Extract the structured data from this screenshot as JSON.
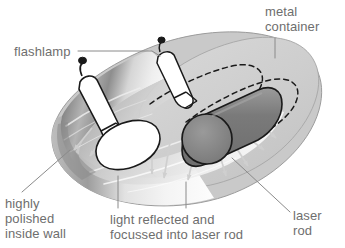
{
  "figure": {
    "background_color": "#ffffff",
    "label_color": "#6e6e6e"
  },
  "labels": {
    "metal_container": "metal\ncontainer",
    "flashlamp": "flashlamp",
    "highly_polished": "highly\npolished\ninside wall",
    "light_reflected": "light reflected and\nfocussed into laser rod",
    "laser_rod": "laser\nrod"
  },
  "colors": {
    "container_body": "#c8c8c8",
    "container_body_edge": "#9a9a9a",
    "container_top": "#d2d2d2",
    "laser_rod_body": "#7d7d7d",
    "laser_rod_end": "#8a8a8a",
    "laser_rod_outline": "#1a1a1a",
    "flashlamp_body": "#ffffff",
    "flashlamp_outline": "#1a1a1a",
    "polished_wall_dark": "#8f8f8f",
    "polished_wall_light": "#f2f2f2",
    "ray_arrow": "#cfcfcf",
    "leader_line": "#8a8a8a",
    "hidden_line": "#1a1a1a"
  },
  "parts": {
    "metal_container": "metal container",
    "flashlamp_front": "flashlamp",
    "flashlamp_rear": "flashlamp",
    "laser_rod": "laser rod",
    "polished_inside_wall": "highly polished inside wall",
    "light_rays": "light reflected and focussed into laser rod"
  },
  "ray_arrows": [
    {
      "x1": 88,
      "y1": 130,
      "x2": 72,
      "y2": 152
    },
    {
      "x1": 112,
      "y1": 120,
      "x2": 86,
      "y2": 159
    },
    {
      "x1": 128,
      "y1": 128,
      "x2": 98,
      "y2": 164
    },
    {
      "x1": 150,
      "y1": 134,
      "x2": 150,
      "y2": 176
    },
    {
      "x1": 170,
      "y1": 132,
      "x2": 162,
      "y2": 180
    },
    {
      "x1": 196,
      "y1": 140,
      "x2": 186,
      "y2": 182
    },
    {
      "x1": 214,
      "y1": 144,
      "x2": 224,
      "y2": 178
    },
    {
      "x1": 228,
      "y1": 140,
      "x2": 246,
      "y2": 168
    },
    {
      "x1": 236,
      "y1": 132,
      "x2": 262,
      "y2": 152
    },
    {
      "x1": 186,
      "y1": 118,
      "x2": 214,
      "y2": 134
    }
  ]
}
